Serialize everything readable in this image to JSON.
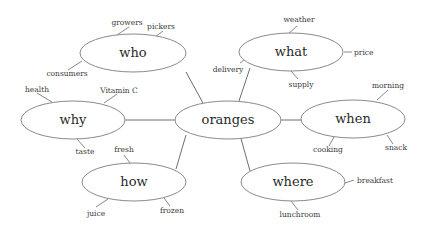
{
  "diagram": {
    "type": "mind-map",
    "center": {
      "id": "oranges",
      "label": "oranges"
    },
    "branches": [
      {
        "id": "who",
        "label": "who",
        "leaves": [
          "growers",
          "pickers",
          "consumers"
        ]
      },
      {
        "id": "what",
        "label": "what",
        "leaves": [
          "weather",
          "price",
          "delivery",
          "supply"
        ]
      },
      {
        "id": "why",
        "label": "why",
        "leaves": [
          "health",
          "Vitamin C",
          "taste"
        ]
      },
      {
        "id": "when",
        "label": "when",
        "leaves": [
          "morning",
          "cooking",
          "snack"
        ]
      },
      {
        "id": "how",
        "label": "how",
        "leaves": [
          "fresh",
          "juice",
          "frozen"
        ]
      },
      {
        "id": "where",
        "label": "where",
        "leaves": [
          "breakfast",
          "lunchroom"
        ]
      }
    ]
  }
}
